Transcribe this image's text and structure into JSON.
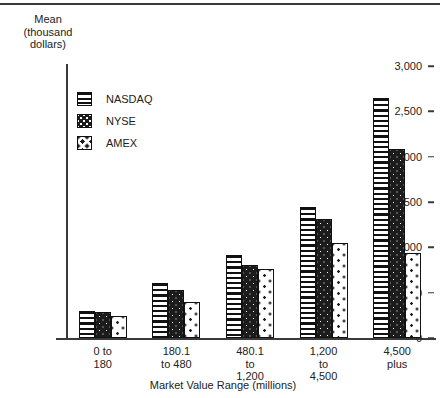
{
  "chart_data": {
    "type": "bar",
    "title": "",
    "subtitle": "",
    "xlabel": "Market Value Range (millions)",
    "ylabel": "Mean\n(thousand\ndollars)",
    "categories": [
      "0 to\n180",
      "180.1\nto 480",
      "480.1\nto\n1,200",
      "1,200\nto\n4,500",
      "4,500\nplus"
    ],
    "series": [
      {
        "name": "NASDAQ",
        "values": [
          300,
          610,
          915,
          1440,
          2650
        ]
      },
      {
        "name": "NYSE",
        "values": [
          285,
          530,
          805,
          1310,
          2080
        ]
      },
      {
        "name": "AMEX",
        "values": [
          240,
          400,
          760,
          1050,
          940
        ]
      }
    ],
    "ylim": [
      0,
      3000
    ],
    "ytick_labels": [
      "0",
      "500",
      "1,000",
      "1,500",
      "2,000",
      "2,500",
      "3,000"
    ],
    "ytick_values": [
      0,
      500,
      1000,
      1500,
      2000,
      2500,
      3000
    ],
    "grid": false,
    "legend_position": "upper-left-inside",
    "legend": [
      {
        "label": "NASDAQ",
        "pattern": "horizontal-stripes",
        "color": "#ffffff"
      },
      {
        "label": "NYSE",
        "pattern": "dark-dotted",
        "color": "#1c1c1c"
      },
      {
        "label": "AMEX",
        "pattern": "light-dotted",
        "color": "#ffffff"
      }
    ]
  }
}
